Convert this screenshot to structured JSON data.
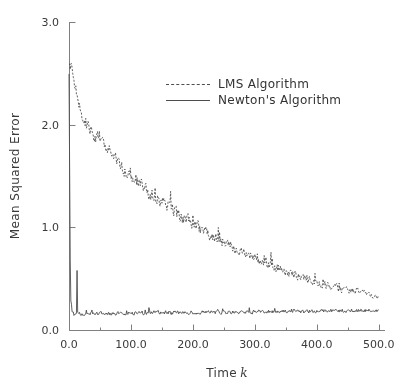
{
  "chart_data": {
    "type": "line",
    "title": "",
    "xlabel": "Time",
    "xlabel_symbol": "k",
    "ylabel": "Mean Squared Error",
    "xlim": [
      0,
      510
    ],
    "ylim": [
      0,
      3.0
    ],
    "xticks": [
      0,
      100,
      200,
      300,
      400,
      500
    ],
    "xtick_labels": [
      "0.0",
      "100.0",
      "200.0",
      "300.0",
      "400.0",
      "500.0"
    ],
    "xminor_interval": 50,
    "yticks": [
      0.0,
      1.0,
      2.0,
      3.0
    ],
    "ytick_labels": [
      "0.0",
      "1.0",
      "2.0",
      "3.0"
    ],
    "grid": false,
    "legend_position": "upper-center",
    "line_color": "#4d4d4d",
    "axis_color": "#808080",
    "series": [
      {
        "name": "LMS Algorithm",
        "style": "dashed",
        "color": "#4d4d4d",
        "noise_amplitude": 0.075,
        "noise_seed": 7391,
        "anchors_x": [
          0,
          5,
          10,
          15,
          20,
          25,
          30,
          35,
          40,
          50,
          60,
          70,
          80,
          90,
          100,
          115,
          130,
          145,
          160,
          175,
          190,
          205,
          220,
          235,
          250,
          265,
          280,
          300,
          320,
          340,
          360,
          380,
          400,
          420,
          440,
          460,
          480,
          500
        ],
        "anchors_y": [
          2.6,
          2.52,
          2.4,
          2.26,
          2.12,
          2.02,
          1.98,
          1.95,
          1.9,
          1.84,
          1.78,
          1.7,
          1.62,
          1.56,
          1.5,
          1.42,
          1.34,
          1.27,
          1.2,
          1.13,
          1.07,
          1.01,
          0.95,
          0.9,
          0.85,
          0.8,
          0.76,
          0.7,
          0.65,
          0.6,
          0.55,
          0.5,
          0.46,
          0.43,
          0.4,
          0.38,
          0.36,
          0.34
        ]
      },
      {
        "name": "Newton's Algorithm",
        "style": "solid",
        "color": "#4d4d4d",
        "noise_amplitude": 0.045,
        "noise_seed": 2264,
        "spike_x": 13,
        "spike_y": 0.58,
        "anchors_x": [
          0,
          1,
          2,
          3,
          5,
          8,
          12,
          20,
          40,
          80,
          140,
          200,
          260,
          320,
          380,
          440,
          500
        ],
        "anchors_y": [
          2.52,
          1.6,
          0.7,
          0.3,
          0.18,
          0.15,
          0.16,
          0.15,
          0.16,
          0.16,
          0.17,
          0.17,
          0.17,
          0.18,
          0.18,
          0.19,
          0.19
        ]
      }
    ]
  },
  "legend": {
    "items": [
      {
        "label": "LMS Algorithm",
        "style": "dashed"
      },
      {
        "label": "Newton's Algorithm",
        "style": "solid"
      }
    ]
  }
}
